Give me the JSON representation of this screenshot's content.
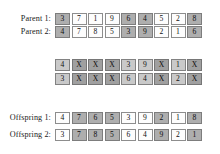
{
  "figure": {
    "title": "",
    "type": "genetic-algorithm-crossover"
  },
  "rows": [
    {
      "id": "parent-1",
      "label": "Parent 1:",
      "top": 13,
      "style": "plain",
      "cells": [
        {
          "value": "3",
          "shaded": true
        },
        {
          "value": "7",
          "shaded": false
        },
        {
          "value": "1",
          "shaded": false
        },
        {
          "value": "9",
          "shaded": false
        },
        {
          "value": "6",
          "shaded": true
        },
        {
          "value": "4",
          "shaded": true
        },
        {
          "value": "5",
          "shaded": false
        },
        {
          "value": "2",
          "shaded": false
        },
        {
          "value": "8",
          "shaded": true
        }
      ]
    },
    {
      "id": "parent-2",
      "label": "Parent 2:",
      "top": 26,
      "style": "plain",
      "cells": [
        {
          "value": "4",
          "shaded": true
        },
        {
          "value": "7",
          "shaded": false
        },
        {
          "value": "8",
          "shaded": false
        },
        {
          "value": "5",
          "shaded": false
        },
        {
          "value": "3",
          "shaded": true
        },
        {
          "value": "9",
          "shaded": true
        },
        {
          "value": "2",
          "shaded": false
        },
        {
          "value": "1",
          "shaded": false
        },
        {
          "value": "6",
          "shaded": true
        }
      ]
    },
    {
      "id": "intermediate-1",
      "label": "",
      "top": 59,
      "style": "mid",
      "cells": [
        {
          "value": "4",
          "shaded": false
        },
        {
          "value": "X",
          "shaded": true
        },
        {
          "value": "X",
          "shaded": true
        },
        {
          "value": "X",
          "shaded": true
        },
        {
          "value": "3",
          "shaded": false
        },
        {
          "value": "9",
          "shaded": false
        },
        {
          "value": "X",
          "shaded": true
        },
        {
          "value": "1",
          "shaded": false
        },
        {
          "value": "X",
          "shaded": true
        }
      ]
    },
    {
      "id": "intermediate-2",
      "label": "",
      "top": 73,
      "style": "mid",
      "cells": [
        {
          "value": "3",
          "shaded": false
        },
        {
          "value": "X",
          "shaded": true
        },
        {
          "value": "X",
          "shaded": true
        },
        {
          "value": "X",
          "shaded": true
        },
        {
          "value": "6",
          "shaded": false
        },
        {
          "value": "4",
          "shaded": false
        },
        {
          "value": "X",
          "shaded": true
        },
        {
          "value": "2",
          "shaded": false
        },
        {
          "value": "X",
          "shaded": true
        }
      ]
    },
    {
      "id": "offspring-1",
      "label": "Offspring 1:",
      "top": 112,
      "style": "plain",
      "cells": [
        {
          "value": "4",
          "shaded": false
        },
        {
          "value": "7",
          "shaded": true
        },
        {
          "value": "6",
          "shaded": true
        },
        {
          "value": "5",
          "shaded": true
        },
        {
          "value": "3",
          "shaded": false
        },
        {
          "value": "9",
          "shaded": false
        },
        {
          "value": "2",
          "shaded": true
        },
        {
          "value": "1",
          "shaded": false
        },
        {
          "value": "8",
          "shaded": true
        }
      ]
    },
    {
      "id": "offspring-2",
      "label": "Offspring 2:",
      "top": 129,
      "style": "plain",
      "cells": [
        {
          "value": "3",
          "shaded": false
        },
        {
          "value": "7",
          "shaded": true
        },
        {
          "value": "8",
          "shaded": true
        },
        {
          "value": "5",
          "shaded": true
        },
        {
          "value": "6",
          "shaded": false
        },
        {
          "value": "4",
          "shaded": false
        },
        {
          "value": "9",
          "shaded": true
        },
        {
          "value": "2",
          "shaded": false
        },
        {
          "value": "1",
          "shaded": true
        }
      ]
    }
  ]
}
